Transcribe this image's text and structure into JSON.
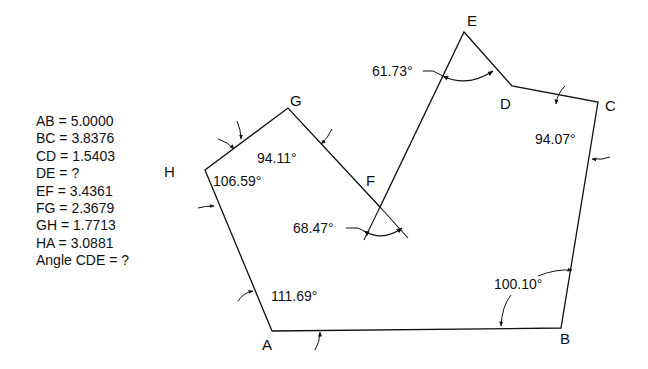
{
  "given_values": [
    {
      "label": "AB = 5.0000"
    },
    {
      "label": "BC = 3.8376"
    },
    {
      "label": "CD = 1.5403"
    },
    {
      "label": "DE = ?"
    },
    {
      "label": "EF = 3.4361"
    },
    {
      "label": "FG = 2.3679"
    },
    {
      "label": "GH = 1.7713"
    },
    {
      "label": "HA = 3.0881"
    },
    {
      "label": "Angle CDE = ?"
    }
  ],
  "vertices": {
    "A": "A",
    "B": "B",
    "C": "C",
    "D": "D",
    "E": "E",
    "F": "F",
    "G": "G",
    "H": "H"
  },
  "angles": {
    "E": "61.73°",
    "C": "94.07°",
    "G": "94.11°",
    "H": "106.59°",
    "F": "68.47°",
    "A": "111.69°",
    "B": "100.10°"
  },
  "colors": {
    "line": "#111111",
    "background": "#ffffff"
  }
}
